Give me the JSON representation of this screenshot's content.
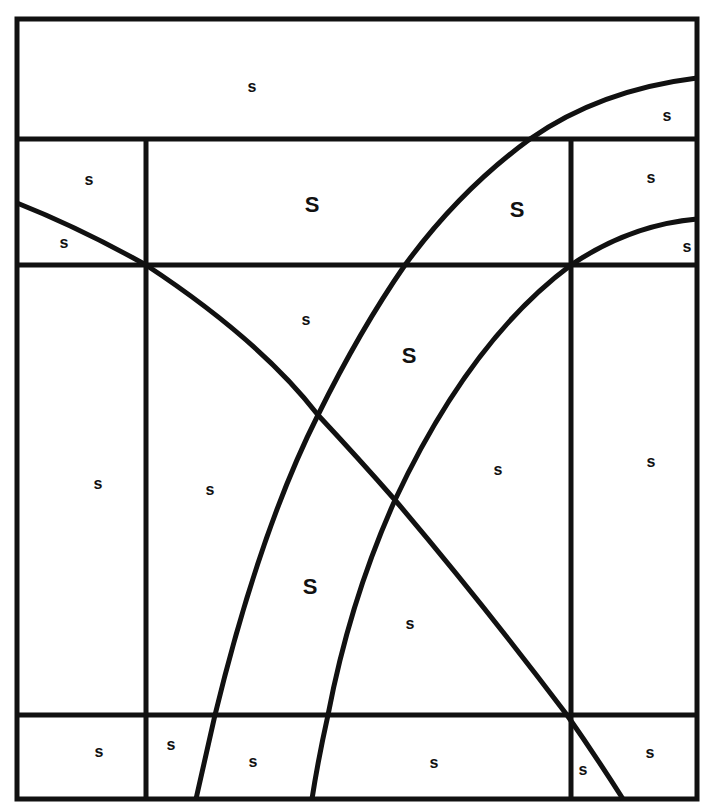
{
  "diagram": {
    "stroke_color": "#111111",
    "background": "#ffffff",
    "frame": {
      "x": 17,
      "y": 19,
      "width": 680,
      "height": 780
    },
    "horizontal_lines_y": [
      139,
      265,
      715
    ],
    "vertical_lines_x": [
      146,
      571
    ],
    "curves": [
      {
        "name": "descending-curve",
        "path": "M17,203 Q80,228 146,265 Q260,340 318,415 Q360,460 395,500 Q480,600 567,715 Q595,755 623,799"
      },
      {
        "name": "outer-rising-curve",
        "path": "M196,799 Q205,760 215,715 Q260,530 318,415 Q360,330 405,265 Q460,190 530,139 Q600,90 697,78"
      },
      {
        "name": "inner-rising-curve",
        "path": "M312,799 Q318,760 328,715 Q350,600 395,500 Q470,340 571,265 Q630,225 697,219"
      }
    ],
    "labels": [
      {
        "text": "s",
        "x": 252,
        "y": 87,
        "size": "sm"
      },
      {
        "text": "s",
        "x": 667,
        "y": 116,
        "size": "sm"
      },
      {
        "text": "s",
        "x": 89,
        "y": 180,
        "size": "sm"
      },
      {
        "text": "S",
        "x": 312,
        "y": 205,
        "size": "lg"
      },
      {
        "text": "S",
        "x": 517,
        "y": 210,
        "size": "lg"
      },
      {
        "text": "s",
        "x": 651,
        "y": 178,
        "size": "sm"
      },
      {
        "text": "s",
        "x": 64,
        "y": 243,
        "size": "sm"
      },
      {
        "text": "s",
        "x": 687,
        "y": 247,
        "size": "sm"
      },
      {
        "text": "s",
        "x": 306,
        "y": 320,
        "size": "sm"
      },
      {
        "text": "S",
        "x": 409,
        "y": 356,
        "size": "lg"
      },
      {
        "text": "s",
        "x": 98,
        "y": 484,
        "size": "sm"
      },
      {
        "text": "s",
        "x": 210,
        "y": 490,
        "size": "sm"
      },
      {
        "text": "s",
        "x": 498,
        "y": 470,
        "size": "sm"
      },
      {
        "text": "s",
        "x": 651,
        "y": 462,
        "size": "sm"
      },
      {
        "text": "S",
        "x": 310,
        "y": 587,
        "size": "lg"
      },
      {
        "text": "s",
        "x": 410,
        "y": 624,
        "size": "sm"
      },
      {
        "text": "s",
        "x": 99,
        "y": 752,
        "size": "sm"
      },
      {
        "text": "s",
        "x": 171,
        "y": 745,
        "size": "sm"
      },
      {
        "text": "s",
        "x": 253,
        "y": 762,
        "size": "sm"
      },
      {
        "text": "s",
        "x": 434,
        "y": 763,
        "size": "sm"
      },
      {
        "text": "s",
        "x": 583,
        "y": 770,
        "size": "sm"
      },
      {
        "text": "s",
        "x": 650,
        "y": 753,
        "size": "sm"
      }
    ]
  }
}
